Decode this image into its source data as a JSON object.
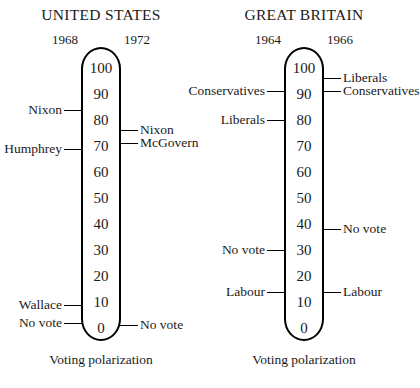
{
  "figure": {
    "caption": "Voting polarization",
    "scale_ticks": [
      100,
      90,
      80,
      70,
      60,
      50,
      40,
      30,
      20,
      10,
      0
    ],
    "scale_min": 0,
    "scale_max": 100
  },
  "panels": [
    {
      "id": "us",
      "title": "UNITED STATES",
      "year_left": "1968",
      "year_right": "1972",
      "caption": "Voting polarization",
      "left_labels": [
        {
          "label": "Nixon",
          "value": 84
        },
        {
          "label": "Humphrey",
          "value": 69
        },
        {
          "label": "Wallace",
          "value": 9
        },
        {
          "label": "No vote",
          "value": 2
        }
      ],
      "right_labels": [
        {
          "label": "Nixon",
          "value": 76
        },
        {
          "label": "McGovern",
          "value": 71
        },
        {
          "label": "No vote",
          "value": 1
        }
      ]
    },
    {
      "id": "gb",
      "title": "GREAT BRITAIN",
      "year_left": "1964",
      "year_right": "1966",
      "caption": "Voting polarization",
      "left_labels": [
        {
          "label": "Conservatives",
          "value": 91
        },
        {
          "label": "Liberals",
          "value": 80
        },
        {
          "label": "No vote",
          "value": 30
        },
        {
          "label": "Labour",
          "value": 14
        }
      ],
      "right_labels": [
        {
          "label": "Liberals",
          "value": 96
        },
        {
          "label": "Conservatives",
          "value": 91
        },
        {
          "label": "No vote",
          "value": 38
        },
        {
          "label": "Labour",
          "value": 14
        }
      ]
    }
  ],
  "chart_data": {
    "type": "scatter",
    "title": "Voting polarization",
    "subtitle": "",
    "xlabel": "",
    "ylabel": "Voting polarization",
    "ylim": [
      0,
      100
    ],
    "grid": false,
    "legend": "none",
    "annotations": [
      "UNITED STATES",
      "GREAT BRITAIN",
      "Voting polarization"
    ],
    "panels": [
      {
        "name": "UNITED STATES",
        "categories": [
          "1968",
          "1972"
        ],
        "series": [
          {
            "name": "1968",
            "points": [
              {
                "label": "Nixon",
                "value": 84
              },
              {
                "label": "Humphrey",
                "value": 69
              },
              {
                "label": "Wallace",
                "value": 9
              },
              {
                "label": "No vote",
                "value": 2
              }
            ]
          },
          {
            "name": "1972",
            "points": [
              {
                "label": "Nixon",
                "value": 76
              },
              {
                "label": "McGovern",
                "value": 71
              },
              {
                "label": "No vote",
                "value": 1
              }
            ]
          }
        ]
      },
      {
        "name": "GREAT BRITAIN",
        "categories": [
          "1964",
          "1966"
        ],
        "series": [
          {
            "name": "1964",
            "points": [
              {
                "label": "Conservatives",
                "value": 91
              },
              {
                "label": "Liberals",
                "value": 80
              },
              {
                "label": "No vote",
                "value": 30
              },
              {
                "label": "Labour",
                "value": 14
              }
            ]
          },
          {
            "name": "1966",
            "points": [
              {
                "label": "Liberals",
                "value": 96
              },
              {
                "label": "Conservatives",
                "value": 91
              },
              {
                "label": "No vote",
                "value": 38
              },
              {
                "label": "Labour",
                "value": 14
              }
            ]
          }
        ]
      }
    ]
  }
}
